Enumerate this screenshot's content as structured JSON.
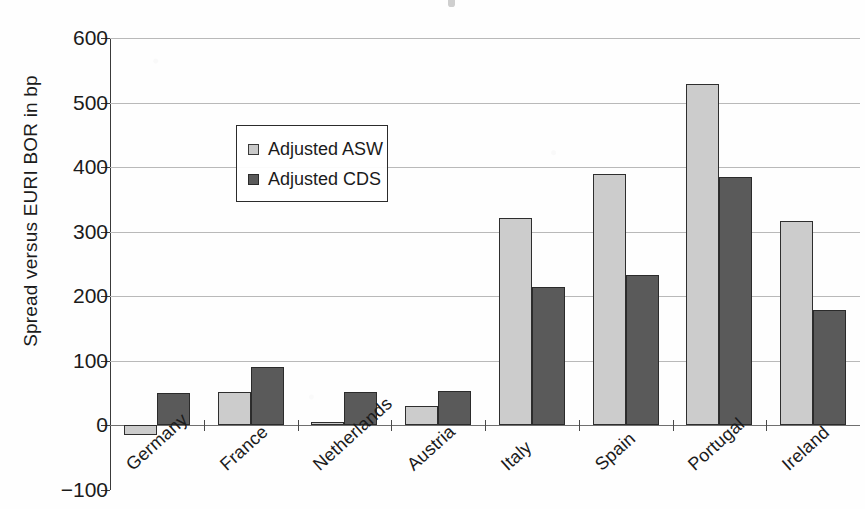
{
  "chart_data": {
    "type": "bar",
    "title": "",
    "xlabel": "",
    "ylabel": "Spread versus EURI BOR in bp",
    "ylim": [
      -100,
      600
    ],
    "ytick_labels": [
      "600",
      "500",
      "400",
      "300",
      "200",
      "100",
      "0",
      "−100"
    ],
    "ytick_values": [
      600,
      500,
      400,
      300,
      200,
      100,
      0,
      -100
    ],
    "grid": true,
    "legend_position": "upper-left-inside",
    "categories": [
      "Germany",
      "France",
      "Netherlands",
      "Austria",
      "Italy",
      "Spain",
      "Portugal",
      "Ireland"
    ],
    "series": [
      {
        "name": "Adjusted ASW",
        "color": "#cccccc",
        "values": [
          -15,
          52,
          6,
          30,
          322,
          390,
          528,
          316
        ]
      },
      {
        "name": "Adjusted CDS",
        "color": "#5a5a5a",
        "values": [
          50,
          90,
          52,
          54,
          215,
          233,
          385,
          179
        ]
      }
    ]
  },
  "legend": {
    "items": [
      {
        "label": "Adjusted ASW"
      },
      {
        "label": "Adjusted CDS"
      }
    ]
  }
}
